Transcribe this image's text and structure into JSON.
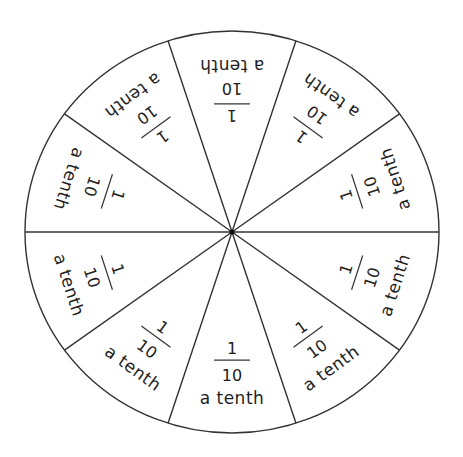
{
  "diagram": {
    "center": [
      232,
      232
    ],
    "radius_x": 207,
    "radius_y": 201,
    "stroke_color": "#333333",
    "text_color": "#1e1e1e",
    "background": "#ffffff",
    "segment_count": 10,
    "segments": [
      {
        "numerator": "1",
        "denominator": "10",
        "word": "a tenth"
      },
      {
        "numerator": "1",
        "denominator": "10",
        "word": "a tenth"
      },
      {
        "numerator": "1",
        "denominator": "10",
        "word": "a tenth"
      },
      {
        "numerator": "1",
        "denominator": "10",
        "word": "a tenth"
      },
      {
        "numerator": "1",
        "denominator": "10",
        "word": "a tenth"
      },
      {
        "numerator": "1",
        "denominator": "10",
        "word": "a tenth"
      },
      {
        "numerator": "1",
        "denominator": "10",
        "word": "a tenth"
      },
      {
        "numerator": "1",
        "denominator": "10",
        "word": "a tenth"
      },
      {
        "numerator": "1",
        "denominator": "10",
        "word": "a tenth"
      },
      {
        "numerator": "1",
        "denominator": "10",
        "word": "a tenth"
      }
    ]
  }
}
